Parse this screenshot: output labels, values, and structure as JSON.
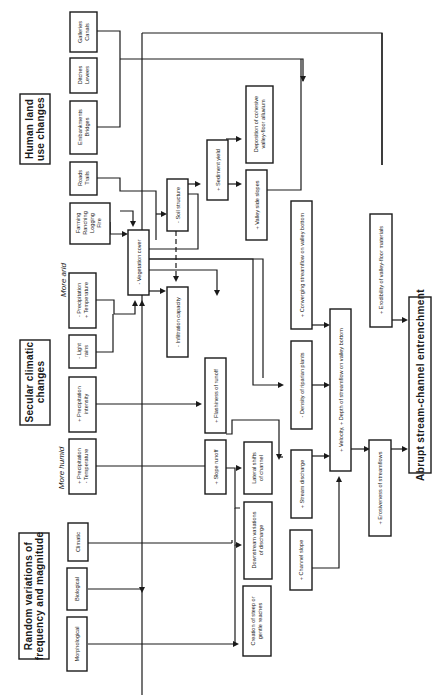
{
  "diagram": {
    "orientation": "rotated 90 degrees counter-clockwise",
    "headers": {
      "human": [
        "Human land",
        "use changes"
      ],
      "secular": [
        "Secular climatic",
        "changes"
      ],
      "random": [
        "Random variations of",
        "frequency and magnitude"
      ]
    },
    "climate_labels": {
      "more_arid": "More arid",
      "more_humid": "More humid"
    },
    "human_boxes": {
      "galleries": [
        "Galleries",
        "Canals"
      ],
      "ditches": [
        "Ditches",
        "Levees"
      ],
      "embankments": [
        "Embankments",
        "Bridges"
      ],
      "roads": [
        "Roads",
        "Trails"
      ],
      "farming": [
        "Farming",
        "Ranching",
        "Logging",
        "Fire"
      ]
    },
    "climate_boxes": {
      "arid_precip": [
        "- Precipitation",
        "+ Temperature"
      ],
      "light_rains": [
        "- Light",
        "rains"
      ],
      "precip_intensity": [
        "+ Precipitation",
        "intensity"
      ],
      "humid_precip": [
        "+ Precipitation",
        "- Temperature"
      ]
    },
    "random_boxes": {
      "climatic": "Climatic",
      "biological": "Biological",
      "morphological": "Morphological"
    },
    "process_boxes": {
      "vegetation_cover": "- Vegetation cover",
      "soil_structure": "- Soil structure",
      "infiltration_capacity": "- Infiltration capacity",
      "sediment_yield": "+ Sediment yield",
      "valley_side_slopes": "+ Valley side slopes",
      "deposition": [
        "Deposition of cohesive",
        "valley-floor alluvium"
      ],
      "flashiness": "+ Flashiness of runoff",
      "slope_runoff": "+ Slope runoff",
      "lateral_shifts": [
        "Lateral shifts",
        "of channel"
      ],
      "downstream_variations": [
        "Downstream variations",
        "of discharge"
      ],
      "steep_reaches": [
        "Creation of steep or",
        "gentle reaches"
      ],
      "riparian_plants": "- Density of riparian plants",
      "stream_discharge": "+ Stream discharge",
      "channel_slope": "+ Channel slope",
      "converging_streamflow": "+ Converging streamflow on valley bottom",
      "velocity_depth": "+ Velocity, + Depth of streamflow on valley bottom",
      "erosiveness": "+ Erosiveness of streamflows",
      "erodibility": "+ Erodibility of valley-floor materials"
    },
    "outcome": "Abrupt stream-channel entrenchment"
  }
}
